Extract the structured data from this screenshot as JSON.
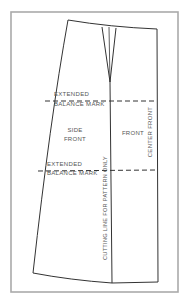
{
  "diagram": {
    "labels": {
      "extended_top_1": "EXTENDED",
      "extended_top_2": "BALANCE MARK",
      "extended_bottom_1": "EXTENDED",
      "extended_bottom_2": "BALANCE MARK",
      "side_front_1": "SIDE",
      "side_front_2": "FRONT",
      "front": "FRONT",
      "center_front": "CENTER FRONT",
      "cutting_line": "CUTTING LINE FOR PATTERN ONLY"
    },
    "colors": {
      "pattern_line": "#333333",
      "frame_border": "#aaaaaa",
      "label_text": "#555555"
    }
  }
}
